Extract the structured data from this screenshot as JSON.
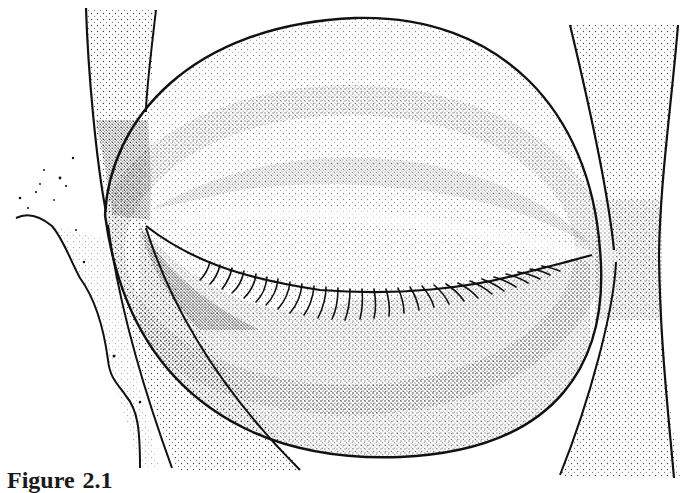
{
  "figure": {
    "type": "stippled anatomical illustration",
    "ink_color": "#111111",
    "background": "#ffffff",
    "components": [
      {
        "name": "eyeball-outline",
        "description": "large oval globe outline"
      },
      {
        "name": "eyelid-fissure",
        "description": "curved lid line from left canthus to right canthus"
      },
      {
        "name": "eyelashes",
        "description": "row of short curved lashes along the lower lid margin"
      },
      {
        "name": "left-band",
        "description": "narrow stippled band on the left side"
      },
      {
        "name": "right-band",
        "description": "hourglass-shaped stippled band on the right side"
      },
      {
        "name": "left-profile",
        "description": "irregular outline at lower left with scattered dots"
      }
    ]
  },
  "caption": {
    "label": "Figure",
    "number": "2.1"
  }
}
